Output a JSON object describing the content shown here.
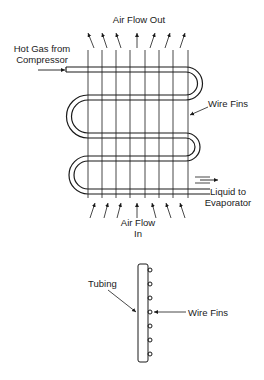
{
  "diagram": {
    "type": "condenser coil schematic",
    "top_view": {
      "labels": {
        "air_out": "Air Flow Out",
        "inlet_line1": "Hot Gas from",
        "inlet_line2": "Compressor",
        "fins": "Wire Fins",
        "outlet_line1": "Liquid to",
        "outlet_line2": "Evaporator",
        "air_in_line1": "Air Flow",
        "air_in_line2": "In"
      },
      "wire_count": 8,
      "serpentine_passes": 5
    },
    "side_view": {
      "labels": {
        "tubing": "Tubing",
        "fins": "Wire Fins"
      },
      "fin_count": 7
    },
    "colors": {
      "line": "#1a1a1a",
      "background": "#ffffff"
    }
  }
}
